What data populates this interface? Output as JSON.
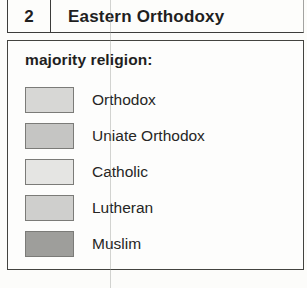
{
  "header": {
    "number": "2",
    "title": "Eastern Orthodoxy"
  },
  "legend": {
    "heading": "majority religion:",
    "items": [
      {
        "label": "Orthodox",
        "color": "#d7d7d5"
      },
      {
        "label": "Uniate Orthodox",
        "color": "#c5c5c3"
      },
      {
        "label": "Catholic",
        "color": "#e5e5e3"
      },
      {
        "label": "Lutheran",
        "color": "#cfcfcd"
      },
      {
        "label": "Muslim",
        "color": "#9e9e9b"
      }
    ]
  },
  "colors": {
    "paper_background": "#fcfcfa",
    "panel_background": "#fdfdfc",
    "box_border": "#3c3c3a",
    "swatch_border": "#7b7b78",
    "text": "#1f1f1f",
    "graticule_line": "#969894"
  }
}
